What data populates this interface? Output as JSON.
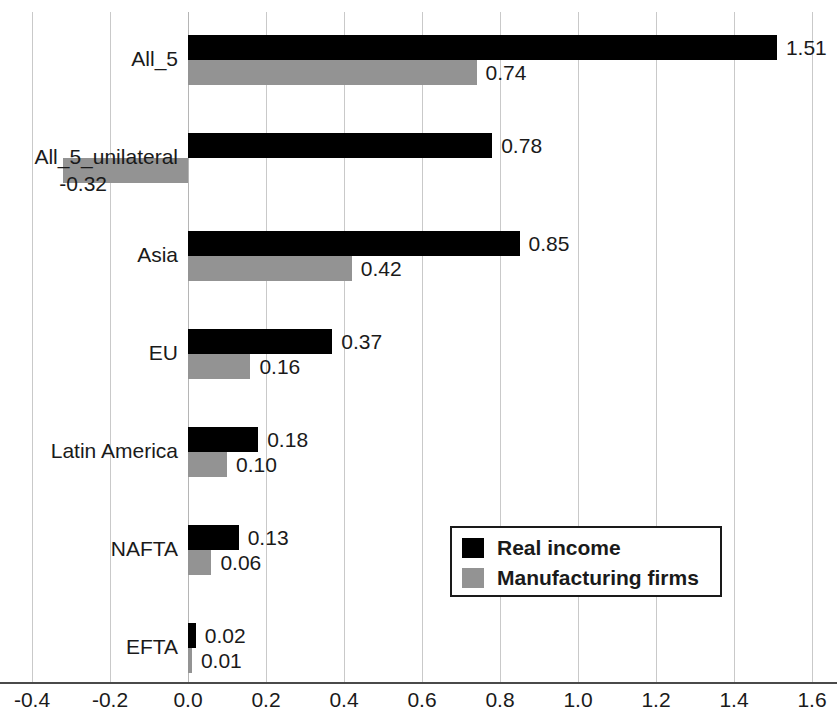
{
  "chart_data": {
    "type": "bar",
    "orientation": "horizontal",
    "title": "",
    "xlabel": "",
    "ylabel": "",
    "xlim": [
      -0.4,
      1.6
    ],
    "xticks": [
      "-0.4",
      "-0.2",
      "0.0",
      "0.2",
      "0.4",
      "0.6",
      "0.8",
      "1.0",
      "1.2",
      "1.4",
      "1.6"
    ],
    "xtick_values": [
      -0.4,
      -0.2,
      0.0,
      0.2,
      0.4,
      0.6,
      0.8,
      1.0,
      1.2,
      1.4,
      1.6
    ],
    "grid": true,
    "legend_position": "center-right",
    "categories": [
      "All_5",
      "All_5_unilateral",
      "Asia",
      "EU",
      "Latin America",
      "NAFTA",
      "EFTA"
    ],
    "series": [
      {
        "name": "Real income",
        "color": "#000000",
        "values": [
          1.51,
          0.78,
          0.85,
          0.37,
          0.18,
          0.13,
          0.02
        ],
        "labels": [
          "1.51",
          "0.78",
          "0.85",
          "0.37",
          "0.18",
          "0.13",
          "0.02"
        ]
      },
      {
        "name": "Manufacturing firms",
        "color": "#939393",
        "values": [
          0.74,
          -0.32,
          0.42,
          0.16,
          0.1,
          0.06,
          0.01
        ],
        "labels": [
          "0.74",
          "-0.32",
          "0.42",
          "0.16",
          "0.10",
          "0.06",
          "0.01"
        ]
      }
    ]
  },
  "legend": {
    "items": [
      {
        "label": "Real income",
        "color": "#000000"
      },
      {
        "label": "Manufacturing firms",
        "color": "#939393"
      }
    ]
  },
  "axis": {
    "ticks": [
      {
        "label": "-0.4"
      },
      {
        "label": "-0.2"
      },
      {
        "label": "0.0"
      },
      {
        "label": "0.2"
      },
      {
        "label": "0.4"
      },
      {
        "label": "0.6"
      },
      {
        "label": "0.8"
      },
      {
        "label": "1.0"
      },
      {
        "label": "1.2"
      },
      {
        "label": "1.4"
      },
      {
        "label": "1.6"
      }
    ]
  },
  "categories": [
    {
      "label": "All_5"
    },
    {
      "label": "All_5_unilateral"
    },
    {
      "label": "Asia"
    },
    {
      "label": "EU"
    },
    {
      "label": "Latin America"
    },
    {
      "label": "NAFTA"
    },
    {
      "label": "EFTA"
    }
  ]
}
